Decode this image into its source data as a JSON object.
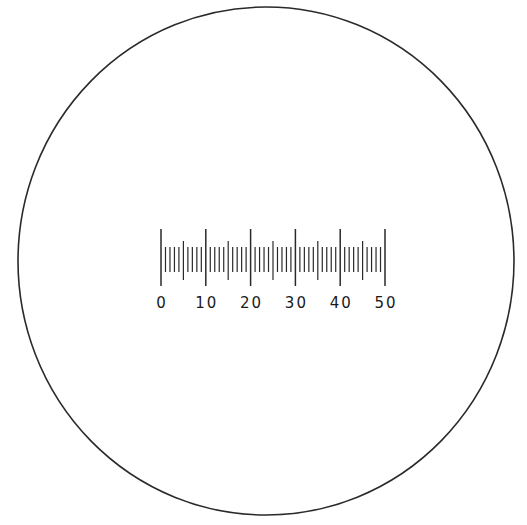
{
  "diagram": {
    "title": "",
    "field_of_view": {
      "shape": "circle",
      "cx": 266,
      "cy": 261,
      "rx": 248,
      "ry": 254,
      "stroke": "#2a2a2a"
    },
    "scale": {
      "type": "ocular micrometer reticle",
      "min": 0,
      "max": 50,
      "minor_step": 1,
      "mid_step": 5,
      "major_step": 10,
      "x0": 161,
      "x50": 385,
      "major_top": 229,
      "major_bottom": 286,
      "mid_top": 241,
      "mid_bottom": 280,
      "minor_top": 247,
      "minor_bottom": 272,
      "stroke": "#2a2a2a",
      "labels": [
        "0",
        "10",
        "20",
        "30",
        "40",
        "50"
      ],
      "label_y": 308
    }
  }
}
